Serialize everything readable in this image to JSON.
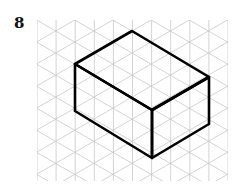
{
  "exercise_number": "8",
  "figure": {
    "grid": "isometric triangular grid",
    "shape": "rectangular prism",
    "dimensions_in_grid_units": {
      "width_left": 4,
      "depth_right": 4,
      "height": 2.5
    },
    "line_color": "#000000",
    "grid_color": "#c8c8c8"
  }
}
